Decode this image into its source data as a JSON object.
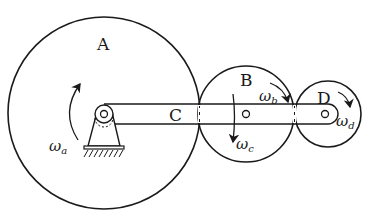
{
  "diagram": {
    "type": "epicyclic gear train",
    "colors": {
      "stroke": "#1a1a1a",
      "background": "#ffffff"
    },
    "gears": [
      {
        "id": "A",
        "label": "A",
        "center": [
          104,
          113
        ],
        "radius": 96
      },
      {
        "id": "B",
        "label": "B",
        "center": [
          246,
          114
        ],
        "radius": 48
      },
      {
        "id": "D",
        "label": "D",
        "center": [
          328,
          114
        ],
        "radius": 33
      }
    ],
    "arm": {
      "id": "C",
      "label": "C",
      "pivot": [
        104,
        114
      ],
      "end": [
        328,
        114
      ]
    },
    "angular_velocities": [
      {
        "id": "wa",
        "symbol": "ω",
        "subscript": "a",
        "direction": "counterclockwise"
      },
      {
        "id": "wb",
        "symbol": "ω",
        "subscript": "b",
        "direction": "clockwise"
      },
      {
        "id": "wc",
        "symbol": "ω",
        "subscript": "c",
        "direction": "down"
      },
      {
        "id": "wd",
        "symbol": "ω",
        "subscript": "d",
        "direction": "clockwise"
      }
    ],
    "support": {
      "label": "fixed ground pivot"
    }
  }
}
